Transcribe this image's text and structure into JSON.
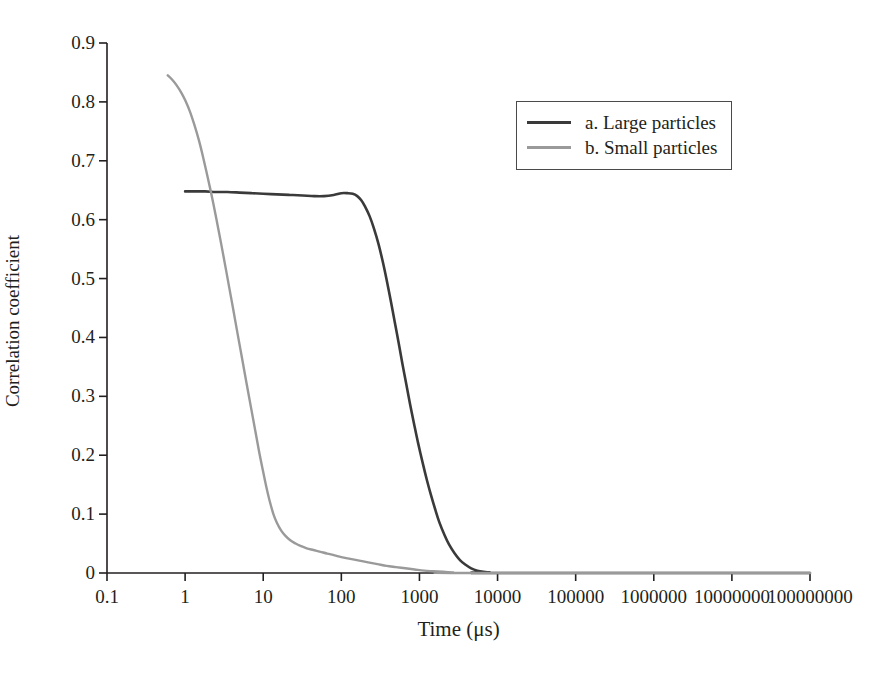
{
  "chart_data": {
    "type": "line",
    "title": "",
    "xlabel": "Time (μs)",
    "ylabel": "Correlation coefficient",
    "xscale": "log",
    "yscale": "linear",
    "xlim": [
      0.1,
      100000000
    ],
    "ylim": [
      0,
      0.9
    ],
    "grid": false,
    "legend_position": "top-right",
    "x_tick_labels": [
      "0.1",
      "1",
      "10",
      "100",
      "1000",
      "10000",
      "100000",
      "1000000",
      "10000000",
      "100000000"
    ],
    "x_tick_values": [
      0.1,
      1,
      10,
      100,
      1000,
      10000,
      100000,
      1000000,
      10000000,
      100000000
    ],
    "y_tick_labels": [
      "0",
      "0.1",
      "0.2",
      "0.3",
      "0.4",
      "0.5",
      "0.6",
      "0.7",
      "0.8",
      "0.9"
    ],
    "y_tick_values": [
      0,
      0.1,
      0.2,
      0.3,
      0.4,
      0.5,
      0.6,
      0.7,
      0.8,
      0.9
    ],
    "series": [
      {
        "name": "a. Large particles",
        "color": "#3a3a3a",
        "points": [
          [
            1.0,
            0.648
          ],
          [
            1.3,
            0.648
          ],
          [
            1.8,
            0.648
          ],
          [
            2.5,
            0.647
          ],
          [
            3.5,
            0.647
          ],
          [
            5.0,
            0.646
          ],
          [
            7.0,
            0.645
          ],
          [
            10.0,
            0.644
          ],
          [
            15.0,
            0.643
          ],
          [
            22.0,
            0.642
          ],
          [
            32.0,
            0.641
          ],
          [
            45.0,
            0.64
          ],
          [
            60.0,
            0.64
          ],
          [
            80.0,
            0.642
          ],
          [
            100.0,
            0.645
          ],
          [
            120.0,
            0.645
          ],
          [
            140.0,
            0.644
          ],
          [
            160.0,
            0.64
          ],
          [
            180.0,
            0.633
          ],
          [
            200.0,
            0.623
          ],
          [
            230.0,
            0.606
          ],
          [
            260.0,
            0.586
          ],
          [
            300.0,
            0.558
          ],
          [
            340.0,
            0.528
          ],
          [
            380.0,
            0.498
          ],
          [
            430.0,
            0.462
          ],
          [
            480.0,
            0.428
          ],
          [
            540.0,
            0.392
          ],
          [
            600.0,
            0.358
          ],
          [
            680.0,
            0.32
          ],
          [
            760.0,
            0.286
          ],
          [
            860.0,
            0.251
          ],
          [
            960.0,
            0.221
          ],
          [
            1100.0,
            0.187
          ],
          [
            1250.0,
            0.157
          ],
          [
            1400.0,
            0.133
          ],
          [
            1600.0,
            0.107
          ],
          [
            1800.0,
            0.086
          ],
          [
            2100.0,
            0.064
          ],
          [
            2400.0,
            0.048
          ],
          [
            2800.0,
            0.034
          ],
          [
            3300.0,
            0.022
          ],
          [
            3900.0,
            0.014
          ],
          [
            4600.0,
            0.008
          ],
          [
            5500.0,
            0.004
          ],
          [
            6600.0,
            0.002
          ],
          [
            8000.0,
            0.001
          ],
          [
            9500.0,
            0.0
          ],
          [
            100000000.0,
            0.0
          ]
        ]
      },
      {
        "name": "b. Small particles",
        "color": "#9a9a9a",
        "points": [
          [
            0.6,
            0.845
          ],
          [
            0.68,
            0.838
          ],
          [
            0.78,
            0.828
          ],
          [
            0.9,
            0.815
          ],
          [
            1.0,
            0.803
          ],
          [
            1.15,
            0.784
          ],
          [
            1.3,
            0.763
          ],
          [
            1.5,
            0.735
          ],
          [
            1.7,
            0.706
          ],
          [
            2.0,
            0.665
          ],
          [
            2.3,
            0.627
          ],
          [
            2.7,
            0.58
          ],
          [
            3.1,
            0.538
          ],
          [
            3.6,
            0.491
          ],
          [
            4.1,
            0.45
          ],
          [
            4.7,
            0.406
          ],
          [
            5.4,
            0.362
          ],
          [
            6.1,
            0.323
          ],
          [
            7.0,
            0.28
          ],
          [
            7.9,
            0.242
          ],
          [
            8.8,
            0.208
          ],
          [
            9.8,
            0.177
          ],
          [
            11.0,
            0.145
          ],
          [
            12.0,
            0.124
          ],
          [
            13.5,
            0.1
          ],
          [
            15.0,
            0.085
          ],
          [
            17.0,
            0.072
          ],
          [
            19.0,
            0.064
          ],
          [
            22.0,
            0.056
          ],
          [
            26.0,
            0.05
          ],
          [
            30.0,
            0.046
          ],
          [
            36.0,
            0.042
          ],
          [
            44.0,
            0.039
          ],
          [
            54.0,
            0.036
          ],
          [
            66.0,
            0.033
          ],
          [
            82.0,
            0.03
          ],
          [
            100.0,
            0.027
          ],
          [
            130.0,
            0.024
          ],
          [
            170.0,
            0.021
          ],
          [
            220.0,
            0.018
          ],
          [
            290.0,
            0.015
          ],
          [
            380.0,
            0.012
          ],
          [
            500.0,
            0.01
          ],
          [
            660.0,
            0.008
          ],
          [
            870.0,
            0.006
          ],
          [
            1150.0,
            0.004
          ],
          [
            1500.0,
            0.003
          ],
          [
            2000.0,
            0.002
          ],
          [
            2700.0,
            0.001
          ],
          [
            3600.0,
            0.0
          ],
          [
            100000000.0,
            0.0
          ]
        ]
      }
    ]
  },
  "legend": {
    "entries": [
      {
        "label": "a. Large particles"
      },
      {
        "label": "b. Small particles"
      }
    ]
  },
  "axes": {
    "x_title": "Time (μs)",
    "y_title": "Correlation coefficient"
  }
}
